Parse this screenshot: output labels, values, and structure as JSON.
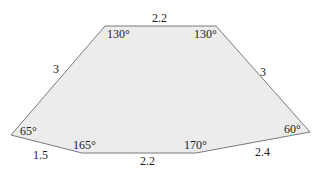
{
  "figure": {
    "type": "hexagon",
    "fill": "#ececec",
    "stroke": "#7a7a7a",
    "vertices": [
      {
        "id": "top-left",
        "x": 105,
        "y": 26
      },
      {
        "id": "top-right",
        "x": 216,
        "y": 26
      },
      {
        "id": "right",
        "x": 310,
        "y": 132
      },
      {
        "id": "bottom-right",
        "x": 196,
        "y": 153
      },
      {
        "id": "bottom-left",
        "x": 82,
        "y": 153
      },
      {
        "id": "left",
        "x": 11,
        "y": 135
      }
    ]
  },
  "angles": {
    "top_left": "130°",
    "top_right": "130°",
    "left": "65°",
    "right": "60°",
    "bottom_left": "165°",
    "bottom_right": "170°"
  },
  "sides": {
    "top": "2.2",
    "upper_left": "3",
    "upper_right": "3",
    "lower_left": "1.5",
    "bottom": "2.2",
    "lower_right": "2.4"
  }
}
